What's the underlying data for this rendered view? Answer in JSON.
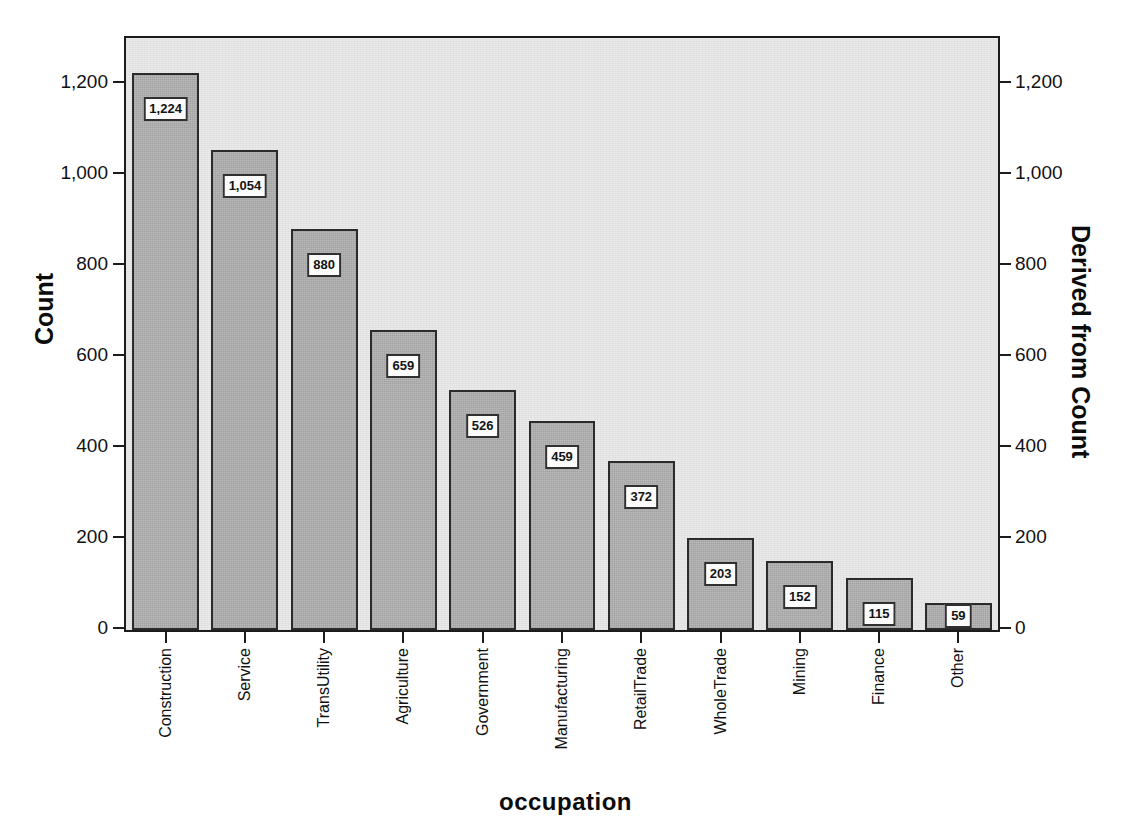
{
  "chart_data": {
    "type": "bar",
    "title": "",
    "xlabel": "occupation",
    "ylabel": "Count",
    "y2label": "Derived from Count",
    "categories": [
      "Construction",
      "Service",
      "TransUtility",
      "Agriculture",
      "Government",
      "Manufacturing",
      "RetailTrade",
      "WholeTrade",
      "Mining",
      "Finance",
      "Other"
    ],
    "values": [
      1224,
      1054,
      880,
      659,
      526,
      459,
      372,
      203,
      152,
      115,
      59
    ],
    "data_labels": [
      "1,224",
      "1,054",
      "880",
      "659",
      "526",
      "459",
      "372",
      "203",
      "152",
      "115",
      "59"
    ],
    "ylim": [
      0,
      1300
    ],
    "yticks": [
      0,
      200,
      400,
      600,
      800,
      1000,
      1200
    ],
    "ytick_labels": [
      "0",
      "200",
      "400",
      "600",
      "800",
      "1,000",
      "1,200"
    ],
    "y2ticks": [
      0,
      200,
      400,
      600,
      800,
      1000,
      1200
    ],
    "y2tick_labels": [
      "0",
      "200",
      "400",
      "600",
      "800",
      "1,000",
      "1,200"
    ],
    "grid": false,
    "legend": "none",
    "bar_color": "#b2b2b2",
    "bar_edge_color": "#2b2b2b",
    "plot_background": "#e9e9e9",
    "frame_color": "#1c1c1c"
  }
}
